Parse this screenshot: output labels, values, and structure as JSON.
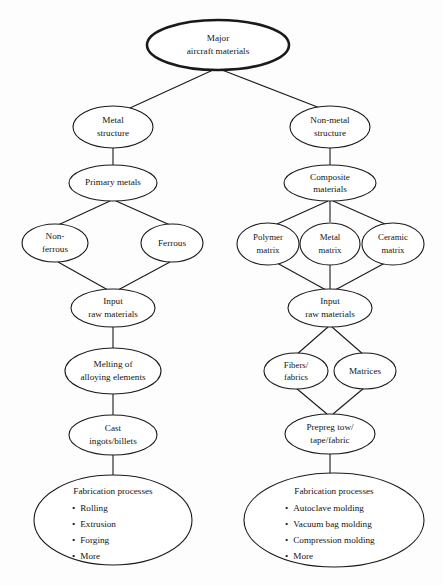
{
  "diagram": {
    "style": {
      "background": "#fdfdfd",
      "line_color": "#1a1a1a",
      "node_fill": "#ffffff",
      "text_color": "#141414"
    },
    "nodes": {
      "root": {
        "lines": [
          "Major",
          "aircraft materials"
        ]
      },
      "metal_structure": {
        "lines": [
          "Metal",
          "structure"
        ]
      },
      "nonmetal_structure": {
        "lines": [
          "Non-metal",
          "structure"
        ]
      },
      "primary_metals": {
        "lines": [
          "Primary metals"
        ]
      },
      "composite_materials": {
        "lines": [
          "Composite",
          "materials"
        ]
      },
      "non_ferrous": {
        "lines": [
          "Non-",
          "ferrous"
        ]
      },
      "ferrous": {
        "lines": [
          "Ferrous"
        ]
      },
      "polymer_matrix": {
        "lines": [
          "Polymer",
          "matrix"
        ]
      },
      "metal_matrix": {
        "lines": [
          "Metal",
          "matrix"
        ]
      },
      "ceramic_matrix": {
        "lines": [
          "Ceramic",
          "matrix"
        ]
      },
      "input_raw_left": {
        "lines": [
          "Input",
          "raw materials"
        ]
      },
      "input_raw_right": {
        "lines": [
          "Input",
          "raw materials"
        ]
      },
      "melting": {
        "lines": [
          "Melting of",
          "alloying elements"
        ]
      },
      "cast_ingots": {
        "lines": [
          "Cast",
          "ingots/billets"
        ]
      },
      "fibers_fabrics": {
        "lines": [
          "Fibers/",
          "fabrics"
        ]
      },
      "matrices": {
        "lines": [
          "Matrices"
        ]
      },
      "prepreg": {
        "lines": [
          "Prepreg tow/",
          "tape/fabric"
        ]
      },
      "fabrication_left": {
        "title": "Fabrication processes",
        "items": [
          "Rolling",
          "Extrusion",
          "Forging",
          "More"
        ]
      },
      "fabrication_right": {
        "title": "Fabrication processes",
        "items": [
          "Autoclave molding",
          "Vacuum bag molding",
          "Compression molding",
          "More"
        ]
      }
    },
    "bullet_glyph": "•"
  }
}
